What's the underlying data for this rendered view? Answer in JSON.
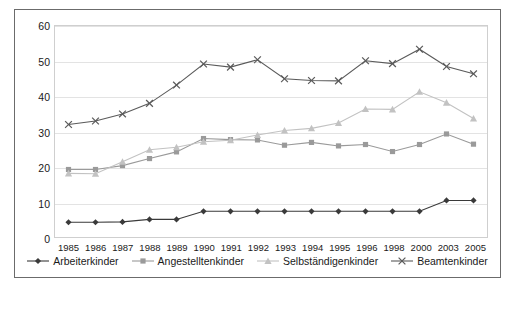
{
  "chart_data": {
    "type": "line",
    "title": "",
    "xlabel": "",
    "ylabel": "",
    "ylim": [
      0,
      60
    ],
    "yticks": [
      0,
      10,
      20,
      30,
      40,
      50,
      60
    ],
    "grid": true,
    "legend_position": "bottom",
    "categories": [
      "1985",
      "1986",
      "1987",
      "1988",
      "1989",
      "1990",
      "1991",
      "1992",
      "1993",
      "1994",
      "1995",
      "1996",
      "1998",
      "2000",
      "2003",
      "2005"
    ],
    "series": [
      {
        "name": "Arbeiterkinder",
        "marker": "diamond",
        "color": "#3a3a3a",
        "values": [
          4.2,
          4.2,
          4.3,
          5.0,
          5.0,
          7.3,
          7.3,
          7.3,
          7.3,
          7.3,
          7.3,
          7.3,
          7.3,
          7.3,
          10.4,
          10.4
        ]
      },
      {
        "name": "Angestelltenkinder",
        "marker": "square",
        "color": "#9a9a9a",
        "values": [
          19.2,
          19.2,
          20.3,
          22.3,
          24.2,
          28.0,
          27.7,
          27.6,
          26.1,
          26.9,
          25.9,
          26.3,
          24.3,
          26.3,
          29.3,
          26.4
        ]
      },
      {
        "name": "Selbständigenkinder",
        "marker": "triangle",
        "color": "#c2c2c2",
        "values": [
          18.1,
          18.0,
          21.4,
          24.8,
          25.5,
          27.1,
          27.5,
          29.0,
          30.3,
          30.9,
          32.4,
          36.4,
          36.3,
          41.3,
          38.2,
          33.7
        ]
      },
      {
        "name": "Beamtenkinder",
        "marker": "cross",
        "color": "#5a5a5a",
        "values": [
          32.0,
          33.0,
          35.0,
          38.0,
          43.2,
          49.2,
          48.3,
          50.4,
          45.0,
          44.5,
          44.4,
          50.1,
          49.3,
          53.4,
          48.5,
          46.4
        ]
      }
    ]
  }
}
